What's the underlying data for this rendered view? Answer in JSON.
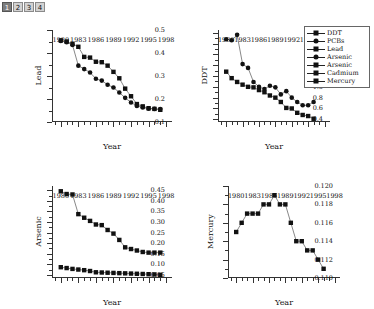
{
  "tabs": [
    {
      "label": "1",
      "active": true
    },
    {
      "label": "2",
      "active": false
    },
    {
      "label": "3",
      "active": false
    },
    {
      "label": "4",
      "active": false
    }
  ],
  "legend": {
    "position": "top-right",
    "items": [
      {
        "label": "DDT",
        "marker": "square",
        "color": "#111111"
      },
      {
        "label": "PCBs",
        "marker": "circle",
        "color": "#111111"
      },
      {
        "label": "Lead",
        "marker": "square",
        "color": "#111111"
      },
      {
        "label": "Arsenic",
        "marker": "circle",
        "color": "#111111"
      },
      {
        "label": "Arsenic",
        "marker": "square",
        "color": "#111111"
      },
      {
        "label": "Cadmium",
        "marker": "square",
        "color": "#111111"
      },
      {
        "label": "Mercury",
        "marker": "square",
        "color": "#111111"
      }
    ]
  },
  "chart_data": [
    {
      "id": "lead",
      "type": "scatter",
      "title": "",
      "xlabel": "Year",
      "ylabel": "Lead",
      "xlim": [
        1978.5,
        1999
      ],
      "ylim": [
        0.1,
        0.5
      ],
      "xticks": [
        1980,
        1983,
        1986,
        1989,
        1992,
        1995,
        1998
      ],
      "xticklabels": [
        "1980",
        "1983",
        "1986",
        "1989",
        "1992",
        "1995",
        "1998"
      ],
      "yticks": [
        0.1,
        0.2,
        0.3,
        0.4,
        0.5
      ],
      "yticklabels": [
        "0.1",
        "0.2",
        "0.3",
        "0.4",
        "0.5"
      ],
      "grid": false,
      "x": [
        1980,
        1981,
        1982,
        1983,
        1984,
        1985,
        1986,
        1987,
        1988,
        1989,
        1990,
        1991,
        1992,
        1993,
        1994,
        1995,
        1996,
        1997
      ],
      "series": [
        {
          "name": "Lead",
          "marker": "square",
          "values": [
            0.455,
            0.45,
            0.44,
            0.427,
            0.383,
            0.38,
            0.362,
            0.36,
            0.345,
            0.318,
            0.29,
            0.245,
            0.212,
            0.178,
            0.168,
            0.16,
            0.157,
            0.153
          ]
        },
        {
          "name": "Cadmium",
          "marker": "circle",
          "values": [
            0.452,
            0.447,
            0.435,
            0.345,
            0.33,
            0.315,
            0.288,
            0.28,
            0.262,
            0.25,
            0.228,
            0.205,
            0.185,
            0.17,
            0.163,
            0.158,
            0.157,
            0.156
          ]
        }
      ]
    },
    {
      "id": "ddt",
      "type": "scatter",
      "title": "",
      "xlabel": "Year",
      "ylabel": "DDT",
      "xlim": [
        1978.5,
        1999
      ],
      "ylim": [
        0.35,
        2.05
      ],
      "xticks": [
        1980,
        1983,
        1986,
        1989,
        1992,
        1995,
        1998
      ],
      "xticklabels": [
        "1980",
        "1983",
        "1986",
        "1989",
        "1992",
        "1995",
        "1998"
      ],
      "yticks": [
        0.4,
        0.6,
        0.8,
        1.0,
        1.2,
        1.4,
        1.6,
        1.8,
        2.0
      ],
      "yticklabels": [
        "0.4",
        "0.6",
        "0.8",
        "1.0",
        "1.2",
        "1.4",
        "1.6",
        "1.8",
        "2.0"
      ],
      "grid": false,
      "x": [
        1980,
        1981,
        1982,
        1983,
        1984,
        1985,
        1986,
        1987,
        1988,
        1989,
        1990,
        1991,
        1992,
        1993,
        1994,
        1995,
        1996
      ],
      "series": [
        {
          "name": "DDT",
          "marker": "circle",
          "values": [
            1.88,
            1.86,
            1.96,
            1.42,
            1.35,
            1.09,
            1.0,
            0.96,
            1.02,
            0.99,
            0.86,
            0.92,
            0.8,
            0.72,
            0.66,
            0.66,
            0.72
          ]
        },
        {
          "name": "PCBs",
          "marker": "square",
          "values": [
            1.28,
            1.16,
            1.09,
            1.04,
            1.0,
            0.99,
            0.94,
            0.9,
            0.84,
            0.8,
            0.72,
            0.61,
            0.6,
            0.52,
            0.48,
            0.46,
            0.41
          ]
        }
      ]
    },
    {
      "id": "arsenic",
      "type": "scatter",
      "title": "",
      "xlabel": "Year",
      "ylabel": "Arsenic",
      "xlim": [
        1978.5,
        1999
      ],
      "ylim": [
        0.035,
        0.47
      ],
      "xticks": [
        1980,
        1983,
        1986,
        1989,
        1992,
        1995,
        1998
      ],
      "xticklabels": [
        "1980",
        "1983",
        "1986",
        "1989",
        "1992",
        "1995",
        "1998"
      ],
      "yticks": [
        0.05,
        0.1,
        0.15,
        0.2,
        0.25,
        0.3,
        0.35,
        0.4,
        0.45
      ],
      "yticklabels": [
        "0.05",
        "0.10",
        "0.15",
        "0.20",
        "0.25",
        "0.30",
        "0.35",
        "0.40",
        "0.45"
      ],
      "grid": false,
      "x": [
        1980,
        1981,
        1982,
        1983,
        1984,
        1985,
        1986,
        1987,
        1988,
        1989,
        1990,
        1991,
        1992,
        1993,
        1994,
        1995,
        1996,
        1997
      ],
      "series": [
        {
          "name": "Arsenic upper",
          "marker": "square",
          "values": [
            0.445,
            0.432,
            0.43,
            0.337,
            0.32,
            0.305,
            0.288,
            0.285,
            0.262,
            0.245,
            0.215,
            0.18,
            0.172,
            0.165,
            0.158,
            0.155,
            0.155,
            0.155
          ]
        },
        {
          "name": "Arsenic lower",
          "marker": "square",
          "values": [
            0.086,
            0.082,
            0.078,
            0.075,
            0.072,
            0.068,
            0.062,
            0.061,
            0.06,
            0.059,
            0.058,
            0.057,
            0.056,
            0.055,
            0.054,
            0.053,
            0.052,
            0.05
          ]
        }
      ]
    },
    {
      "id": "mercury",
      "type": "line",
      "title": "",
      "xlabel": "Year",
      "ylabel": "Mercury",
      "xlim": [
        1978.5,
        1999
      ],
      "ylim": [
        0.11,
        0.12
      ],
      "xticks": [
        1980,
        1983,
        1986,
        1989,
        1992,
        1995,
        1998
      ],
      "xticklabels": [
        "1980",
        "1983",
        "1986",
        "1989",
        "1992",
        "1995",
        "1998"
      ],
      "yticks": [
        0.11,
        0.112,
        0.114,
        0.116,
        0.118,
        0.12
      ],
      "yticklabels": [
        "0.110",
        "0.112",
        "0.114",
        "0.116",
        "0.118",
        "0.120"
      ],
      "grid": false,
      "x": [
        1980,
        1981,
        1982,
        1983,
        1984,
        1985,
        1986,
        1987,
        1988,
        1989,
        1990,
        1991,
        1992,
        1993,
        1994,
        1995,
        1996
      ],
      "series": [
        {
          "name": "Mercury",
          "marker": "square",
          "values": [
            0.115,
            0.116,
            0.117,
            0.117,
            0.117,
            0.118,
            0.118,
            0.119,
            0.118,
            0.118,
            0.116,
            0.114,
            0.114,
            0.113,
            0.113,
            0.112,
            0.111
          ]
        }
      ]
    }
  ]
}
